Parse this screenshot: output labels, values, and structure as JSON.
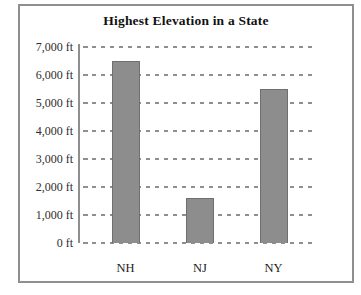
{
  "chart_data": {
    "type": "bar",
    "title": "Highest Elevation in a State",
    "categories": [
      "NH",
      "NJ",
      "NY"
    ],
    "values": [
      6500,
      1600,
      5500
    ],
    "unit": "ft",
    "xlabel": "",
    "ylabel": "",
    "ylim": [
      0,
      7000
    ],
    "y_ticks": [
      {
        "value": 7000,
        "label": "7,000 ft"
      },
      {
        "value": 6000,
        "label": "6,000 ft"
      },
      {
        "value": 5000,
        "label": "5,000 ft"
      },
      {
        "value": 4000,
        "label": "4,000 ft"
      },
      {
        "value": 3000,
        "label": "3,000 ft"
      },
      {
        "value": 2000,
        "label": "2,000 ft"
      },
      {
        "value": 1000,
        "label": "1,000 ft"
      },
      {
        "value": 0,
        "label": "0 ft"
      }
    ],
    "grid": "dashed-horizontal",
    "legend": "none",
    "colors": {
      "bar_fill": "#8d8d8d",
      "bar_border": "#6f6f6f",
      "gridline": "#8f8f8f",
      "axis": "#8f8f8f",
      "frame": "#8f8f8f",
      "title_text": "#111111",
      "tick_text": "#2e2e2e",
      "category_text": "#1c1c1c"
    }
  }
}
